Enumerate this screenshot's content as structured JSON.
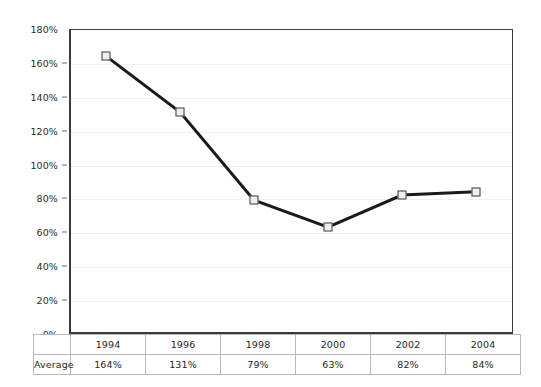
{
  "chart_data": {
    "type": "line",
    "title": "",
    "subtitle": "",
    "xlabel": "",
    "ylabel": "",
    "categories": [
      "1994",
      "1996",
      "1998",
      "2000",
      "2002",
      "2004"
    ],
    "series": [
      {
        "name": "Average",
        "values": [
          164,
          131,
          79,
          63,
          82,
          84
        ],
        "value_labels": [
          "164%",
          "131%",
          "79%",
          "63%",
          "82%",
          "84%"
        ],
        "line_color": "#1a1a1a",
        "marker_fill": "#efefef",
        "marker_edge": "#3b3b3b"
      }
    ],
    "ylim": [
      0,
      180
    ],
    "ytick_values": [
      180,
      160,
      140,
      120,
      100,
      80,
      60,
      40,
      20,
      0
    ],
    "ytick_labels": [
      "180%",
      "160%",
      "140%",
      "120%",
      "100%",
      "80%",
      "60%",
      "40%",
      "20%",
      "0%"
    ],
    "grid": true,
    "gridline_color": "#f1f1f1",
    "legend": false,
    "legend_position": "none",
    "plot_border_color": "#3a3a3a",
    "background": "#ffffff"
  },
  "table": {
    "row_label": "Average",
    "corner_label": "",
    "headers": [
      "1994",
      "1996",
      "1998",
      "2000",
      "2002",
      "2004"
    ],
    "values": [
      "164%",
      "131%",
      "79%",
      "63%",
      "82%",
      "84%"
    ],
    "border_color": "#b9b9b9"
  },
  "axis": {
    "ticks": [
      {
        "label": "180%",
        "value": 180
      },
      {
        "label": "160%",
        "value": 160
      },
      {
        "label": "140%",
        "value": 140
      },
      {
        "label": "120%",
        "value": 120
      },
      {
        "label": "100%",
        "value": 100
      },
      {
        "label": "80%",
        "value": 80
      },
      {
        "label": "60%",
        "value": 60
      },
      {
        "label": "40%",
        "value": 40
      },
      {
        "label": "20%",
        "value": 20
      },
      {
        "label": "0%",
        "value": 0
      }
    ]
  }
}
